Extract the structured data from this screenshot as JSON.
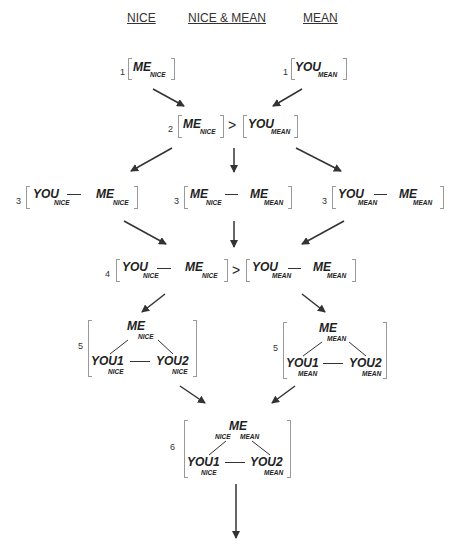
{
  "headers": {
    "nice": "NICE",
    "both": "NICE & MEAN",
    "mean": "MEAN"
  },
  "labels": {
    "me": "ME",
    "you": "YOU",
    "you1": "YOU1",
    "you2": "YOU2",
    "nice": "NICE",
    "mean": "MEAN",
    "gt": ">"
  },
  "steps": {
    "s1": "1",
    "s2": "2",
    "s3": "3",
    "s4": "4",
    "s5": "5",
    "s6": "6"
  },
  "colors": {
    "ink": "#222222",
    "bracket": "#999999"
  }
}
